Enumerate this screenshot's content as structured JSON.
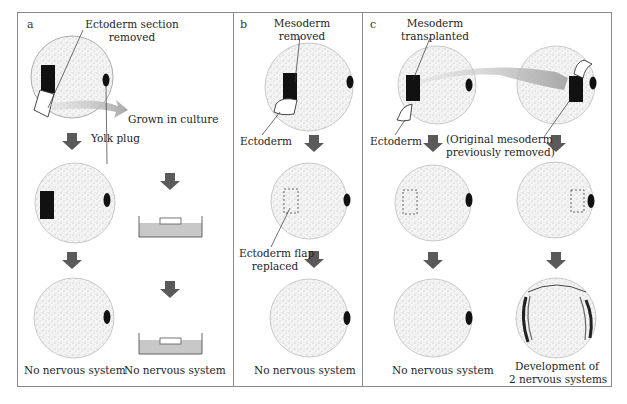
{
  "figure": {
    "panels": [
      {
        "letter": "a",
        "labels": {
          "top": [
            "Ectoderm section",
            "removed"
          ],
          "culture": "Grown in culture",
          "yolk": "Yolk plug",
          "result_left": "No nervous system",
          "result_right": "No nervous system"
        }
      },
      {
        "letter": "b",
        "labels": {
          "top": [
            "Mesoderm",
            "removed"
          ],
          "ectoderm": "Ectoderm",
          "flap": [
            "Ectoderm flap",
            "replaced"
          ],
          "result": "No nervous system"
        }
      },
      {
        "letter": "c",
        "labels": {
          "top": [
            "Mesoderm",
            "transplanted"
          ],
          "ectoderm": "Ectoderm",
          "original": [
            "(Original mesoderm",
            "previously removed)"
          ],
          "result_left": "No nervous system",
          "result_right": [
            "Development of",
            "2 nervous systems"
          ]
        }
      }
    ],
    "colors": {
      "border": "#8a8a8a",
      "arrow": "#5a5a5a",
      "transfer_arrow": "#b8b8b8",
      "dish_fill": "#c8c8c8",
      "tissue": "#111111"
    }
  }
}
